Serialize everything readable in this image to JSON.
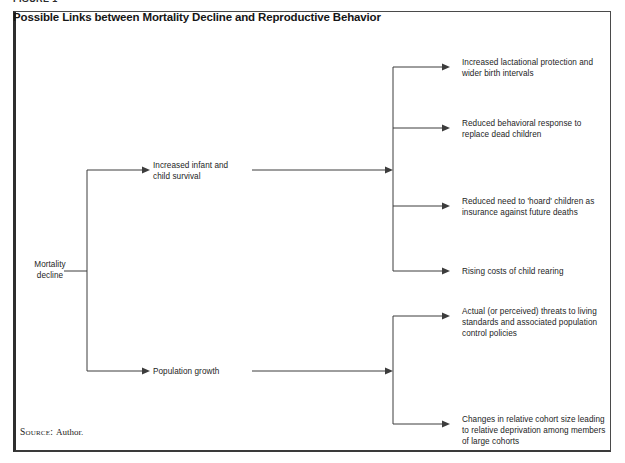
{
  "figure": {
    "label": "FIGURE 1",
    "title": "Possible Links between Mortality Decline and Reproductive Behavior",
    "source_label": "Source:",
    "source_value": "Author."
  },
  "diagram": {
    "type": "flowchart",
    "root": {
      "id": "mortality-decline",
      "label": "Mortality\ndecline"
    },
    "level1": [
      {
        "id": "increased-child-survival",
        "label": "Increased infant and\nchild survival"
      },
      {
        "id": "population-growth",
        "label": "Population growth"
      }
    ],
    "outcomes_from_child_survival": [
      {
        "id": "lactational-protection",
        "label": "Increased lactational protection and\nwider birth intervals"
      },
      {
        "id": "behavioral-response",
        "label": "Reduced behavioral response to\nreplace dead children"
      },
      {
        "id": "hoard-children",
        "label": "Reduced need to 'hoard' children as\ninsurance against future deaths"
      },
      {
        "id": "child-rearing-costs",
        "label": "Rising costs of child rearing"
      }
    ],
    "outcomes_from_population_growth": [
      {
        "id": "living-standards-threats",
        "label": "Actual (or perceived) threats to living\nstandards and associated population\ncontrol policies"
      },
      {
        "id": "cohort-size-changes",
        "label": "Changes in relative cohort size leading\nto relative deprivation among members\nof large cohorts"
      }
    ]
  },
  "colors": {
    "line": "#3c3c3c",
    "frame": "#4a4a4a",
    "text": "#1d1d1d",
    "background": "#ffffff"
  }
}
